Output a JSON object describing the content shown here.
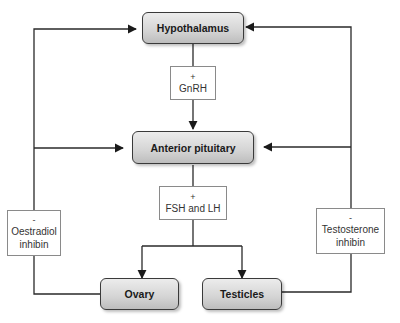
{
  "diagram": {
    "nodes": {
      "hypothalamus": "Hypothalamus",
      "anterior_pituitary": "Anterior pituitary",
      "ovary": "Ovary",
      "testicles": "Testicles"
    },
    "labels": {
      "gnrh": {
        "sign": "+",
        "lines": [
          "GnRH"
        ]
      },
      "fsh_lh": {
        "sign": "+",
        "lines": [
          "FSH and LH"
        ]
      },
      "oestradiol": {
        "sign": "-",
        "lines": [
          "Oestradiol",
          "inhibin"
        ]
      },
      "testosterone": {
        "sign": "-",
        "lines": [
          "Testosterone",
          "inhibin"
        ]
      }
    },
    "edges": [
      {
        "from": "Hypothalamus",
        "to": "Anterior pituitary",
        "label": "+ GnRH"
      },
      {
        "from": "Anterior pituitary",
        "to": "Ovary",
        "label": "+ FSH and LH"
      },
      {
        "from": "Anterior pituitary",
        "to": "Testicles",
        "label": "+ FSH and LH"
      },
      {
        "from": "Ovary",
        "to": "Hypothalamus",
        "label": "- Oestradiol inhibin"
      },
      {
        "from": "Ovary",
        "to": "Anterior pituitary",
        "label": "- Oestradiol inhibin"
      },
      {
        "from": "Testicles",
        "to": "Hypothalamus",
        "label": "- Testosterone inhibin"
      },
      {
        "from": "Testicles",
        "to": "Anterior pituitary",
        "label": "- Testosterone inhibin"
      }
    ],
    "colors": {
      "line": "#2a2a2a",
      "node_fill": "#d4d4d4",
      "label_border": "#8a8a8a"
    }
  }
}
